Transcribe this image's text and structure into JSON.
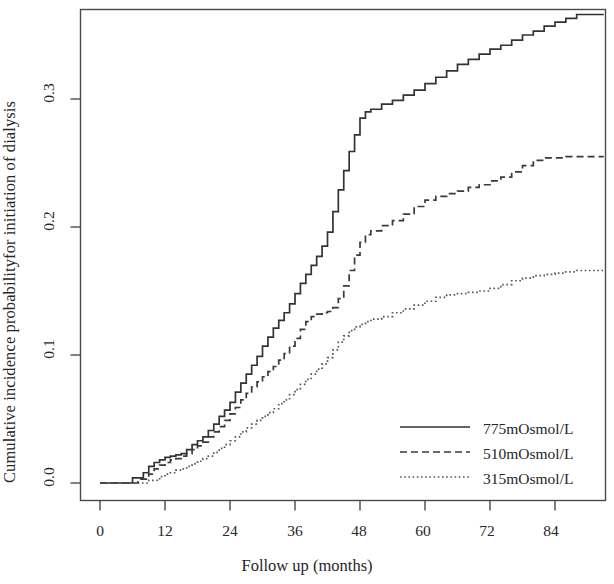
{
  "chart_data": {
    "type": "line",
    "subtype": "cumulative-incidence-step",
    "title": "",
    "xlabel": "Follow up (months)",
    "ylabel": "Cumulative incidence probabilityfor initiation of dialysis",
    "xlim": [
      0,
      93
    ],
    "ylim": [
      0.0,
      0.375
    ],
    "xticks": [
      0,
      12,
      24,
      36,
      48,
      60,
      72,
      84
    ],
    "xtick_labels": [
      "0",
      "12",
      "24",
      "36",
      "48",
      "60",
      "72",
      "84"
    ],
    "yticks": [
      0.0,
      0.1,
      0.2,
      0.3
    ],
    "ytick_labels": [
      "0.0",
      "0.1",
      "0.2",
      "0.3"
    ],
    "grid": false,
    "legend_position": "bottom-right",
    "series": [
      {
        "name": "775mOsmol/L",
        "style": "solid",
        "color": "#333333",
        "points": [
          [
            0,
            0.0
          ],
          [
            5,
            0.0
          ],
          [
            6,
            0.004
          ],
          [
            8,
            0.008
          ],
          [
            9,
            0.013
          ],
          [
            10,
            0.016
          ],
          [
            11,
            0.018
          ],
          [
            12,
            0.02
          ],
          [
            13,
            0.021
          ],
          [
            14,
            0.022
          ],
          [
            15,
            0.023
          ],
          [
            16,
            0.026
          ],
          [
            17,
            0.03
          ],
          [
            18,
            0.033
          ],
          [
            19,
            0.036
          ],
          [
            20,
            0.041
          ],
          [
            21,
            0.046
          ],
          [
            22,
            0.052
          ],
          [
            23,
            0.057
          ],
          [
            24,
            0.063
          ],
          [
            25,
            0.071
          ],
          [
            26,
            0.078
          ],
          [
            27,
            0.085
          ],
          [
            28,
            0.092
          ],
          [
            29,
            0.099
          ],
          [
            30,
            0.107
          ],
          [
            31,
            0.114
          ],
          [
            32,
            0.121
          ],
          [
            33,
            0.127
          ],
          [
            34,
            0.133
          ],
          [
            35,
            0.14
          ],
          [
            36,
            0.148
          ],
          [
            37,
            0.156
          ],
          [
            38,
            0.163
          ],
          [
            39,
            0.17
          ],
          [
            40,
            0.177
          ],
          [
            41,
            0.185
          ],
          [
            42,
            0.196
          ],
          [
            43,
            0.212
          ],
          [
            44,
            0.229
          ],
          [
            45,
            0.244
          ],
          [
            46,
            0.259
          ],
          [
            47,
            0.272
          ],
          [
            48,
            0.285
          ],
          [
            49,
            0.29
          ],
          [
            50,
            0.292
          ],
          [
            52,
            0.296
          ],
          [
            54,
            0.299
          ],
          [
            56,
            0.303
          ],
          [
            58,
            0.307
          ],
          [
            60,
            0.312
          ],
          [
            62,
            0.317
          ],
          [
            64,
            0.322
          ],
          [
            66,
            0.327
          ],
          [
            68,
            0.331
          ],
          [
            70,
            0.335
          ],
          [
            72,
            0.339
          ],
          [
            74,
            0.342
          ],
          [
            76,
            0.346
          ],
          [
            78,
            0.35
          ],
          [
            80,
            0.353
          ],
          [
            82,
            0.357
          ],
          [
            84,
            0.36
          ],
          [
            86,
            0.363
          ],
          [
            88,
            0.366
          ],
          [
            90,
            0.366
          ],
          [
            93,
            0.366
          ]
        ]
      },
      {
        "name": "510mOsmol/L",
        "style": "dashed",
        "color": "#3a3a3a",
        "points": [
          [
            0,
            0.0
          ],
          [
            6,
            0.0
          ],
          [
            7,
            0.003
          ],
          [
            9,
            0.007
          ],
          [
            10,
            0.011
          ],
          [
            11,
            0.014
          ],
          [
            12,
            0.016
          ],
          [
            13,
            0.018
          ],
          [
            14,
            0.019
          ],
          [
            15,
            0.021
          ],
          [
            16,
            0.023
          ],
          [
            17,
            0.026
          ],
          [
            18,
            0.029
          ],
          [
            19,
            0.032
          ],
          [
            20,
            0.036
          ],
          [
            21,
            0.04
          ],
          [
            22,
            0.044
          ],
          [
            23,
            0.049
          ],
          [
            24,
            0.054
          ],
          [
            25,
            0.059
          ],
          [
            26,
            0.065
          ],
          [
            27,
            0.07
          ],
          [
            28,
            0.075
          ],
          [
            29,
            0.079
          ],
          [
            30,
            0.083
          ],
          [
            31,
            0.087
          ],
          [
            32,
            0.091
          ],
          [
            33,
            0.096
          ],
          [
            34,
            0.101
          ],
          [
            35,
            0.107
          ],
          [
            36,
            0.113
          ],
          [
            37,
            0.12
          ],
          [
            38,
            0.126
          ],
          [
            39,
            0.13
          ],
          [
            40,
            0.132
          ],
          [
            41,
            0.133
          ],
          [
            42,
            0.134
          ],
          [
            43,
            0.137
          ],
          [
            44,
            0.144
          ],
          [
            45,
            0.154
          ],
          [
            46,
            0.166
          ],
          [
            47,
            0.178
          ],
          [
            48,
            0.188
          ],
          [
            49,
            0.194
          ],
          [
            50,
            0.197
          ],
          [
            52,
            0.201
          ],
          [
            54,
            0.205
          ],
          [
            56,
            0.21
          ],
          [
            58,
            0.216
          ],
          [
            60,
            0.221
          ],
          [
            62,
            0.224
          ],
          [
            64,
            0.226
          ],
          [
            66,
            0.228
          ],
          [
            68,
            0.231
          ],
          [
            70,
            0.233
          ],
          [
            72,
            0.236
          ],
          [
            74,
            0.239
          ],
          [
            76,
            0.243
          ],
          [
            78,
            0.248
          ],
          [
            80,
            0.252
          ],
          [
            82,
            0.254
          ],
          [
            84,
            0.254
          ],
          [
            86,
            0.255
          ],
          [
            88,
            0.255
          ],
          [
            93,
            0.255
          ]
        ]
      },
      {
        "name": "315mOsmol/L",
        "style": "dotted",
        "color": "#555555",
        "points": [
          [
            0,
            0.0
          ],
          [
            7,
            0.0
          ],
          [
            9,
            0.002
          ],
          [
            11,
            0.005
          ],
          [
            12,
            0.007
          ],
          [
            13,
            0.008
          ],
          [
            14,
            0.01
          ],
          [
            15,
            0.011
          ],
          [
            16,
            0.013
          ],
          [
            17,
            0.015
          ],
          [
            18,
            0.017
          ],
          [
            19,
            0.019
          ],
          [
            20,
            0.021
          ],
          [
            21,
            0.024
          ],
          [
            22,
            0.027
          ],
          [
            23,
            0.03
          ],
          [
            24,
            0.033
          ],
          [
            25,
            0.036
          ],
          [
            26,
            0.04
          ],
          [
            27,
            0.043
          ],
          [
            28,
            0.046
          ],
          [
            29,
            0.049
          ],
          [
            30,
            0.052
          ],
          [
            31,
            0.055
          ],
          [
            32,
            0.058
          ],
          [
            33,
            0.062
          ],
          [
            34,
            0.065
          ],
          [
            35,
            0.069
          ],
          [
            36,
            0.073
          ],
          [
            37,
            0.077
          ],
          [
            38,
            0.081
          ],
          [
            39,
            0.085
          ],
          [
            40,
            0.089
          ],
          [
            41,
            0.093
          ],
          [
            42,
            0.098
          ],
          [
            43,
            0.104
          ],
          [
            44,
            0.11
          ],
          [
            45,
            0.115
          ],
          [
            46,
            0.119
          ],
          [
            47,
            0.122
          ],
          [
            48,
            0.124
          ],
          [
            49,
            0.126
          ],
          [
            50,
            0.128
          ],
          [
            52,
            0.13
          ],
          [
            54,
            0.133
          ],
          [
            56,
            0.136
          ],
          [
            58,
            0.139
          ],
          [
            60,
            0.142
          ],
          [
            62,
            0.145
          ],
          [
            64,
            0.147
          ],
          [
            66,
            0.148
          ],
          [
            68,
            0.149
          ],
          [
            70,
            0.15
          ],
          [
            72,
            0.152
          ],
          [
            74,
            0.155
          ],
          [
            76,
            0.158
          ],
          [
            78,
            0.16
          ],
          [
            80,
            0.162
          ],
          [
            82,
            0.163
          ],
          [
            84,
            0.164
          ],
          [
            86,
            0.165
          ],
          [
            88,
            0.166
          ],
          [
            93,
            0.166
          ]
        ]
      }
    ]
  },
  "legend": {
    "items": [
      {
        "label": "775mOsmol/L",
        "style": "solid"
      },
      {
        "label": "510mOsmol/L",
        "style": "dashed"
      },
      {
        "label": "315mOsmol/L",
        "style": "dotted"
      }
    ]
  },
  "axes": {
    "x_title": "Follow up (months)",
    "y_title": "Cumulative incidence probabilityfor initiation of dialysis",
    "x_tick_0": "0",
    "x_tick_1": "12",
    "x_tick_2": "24",
    "x_tick_3": "36",
    "x_tick_4": "48",
    "x_tick_5": "60",
    "x_tick_6": "72",
    "x_tick_7": "84",
    "y_tick_0": "0.0",
    "y_tick_1": "0.1",
    "y_tick_2": "0.2",
    "y_tick_3": "0.3"
  }
}
